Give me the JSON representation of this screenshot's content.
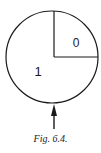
{
  "figure": {
    "caption": "Fig. 6.4.",
    "sectors": [
      {
        "label": "0",
        "position": "top-right quarter"
      },
      {
        "label": "1",
        "position": "remaining three quarters"
      }
    ],
    "arrow": {
      "direction": "up",
      "position": "bottom of circle"
    },
    "colors": {
      "stroke": "#1a1a1a",
      "background": "#ffffff"
    }
  }
}
